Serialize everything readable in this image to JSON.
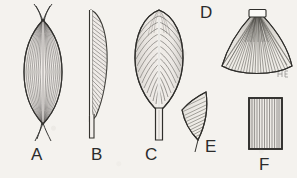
{
  "plate": {
    "background_color": "#f4f2ee",
    "ink_color": "#2b2b2b",
    "medium": "pen-and-ink line drawing",
    "subject": "leaf morphology specimens",
    "specimen_count": 6
  },
  "labels": {
    "a": "A",
    "b": "B",
    "c": "C",
    "d": "D",
    "e": "E",
    "f": "F"
  },
  "specimens": [
    {
      "id": "A",
      "name": "spindle-shaped leaf",
      "form": "fusiform blade with tapering splayed tips at both ends",
      "venation": "fine parallel longitudinal veins"
    },
    {
      "id": "B",
      "name": "half-blade leaf",
      "form": "narrow asymmetric blade, straight left midrib edge, curved right margin, tapering to a stalk",
      "venation": "oblique parallel veins"
    },
    {
      "id": "C",
      "name": "ovate leaf with petiole",
      "form": "broad ovate blade on a thick stalk",
      "venation": "pinnate lateral veins from a pale midrib"
    },
    {
      "id": "D",
      "name": "fan-shaped leaf",
      "form": "flabellate pleated fan radiating from a small rectangular basal sheath",
      "venation": "radiating plicate folds"
    },
    {
      "id": "E",
      "name": "rhombic leaf segment",
      "form": "diamond-shaped fragment with a short tip",
      "venation": "diagonal parallel hatching"
    },
    {
      "id": "F",
      "name": "rectangular leaf segment",
      "form": "rectangular panel with dark outlined border",
      "venation": "vertical parallel veins"
    }
  ],
  "artist_mark": {
    "text": "",
    "note": "faint monogram at lower right of specimen D"
  }
}
